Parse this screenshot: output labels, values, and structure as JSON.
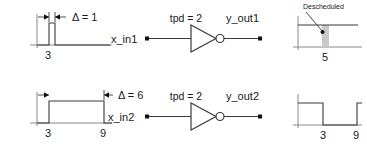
{
  "figure": {
    "rows": [
      {
        "id": "row-1",
        "input_waveform": {
          "name": "narrow-input-pulse",
          "delta_label": "Δ = 1",
          "time_labels": [
            "3"
          ],
          "edges": [
            3,
            4
          ],
          "style": "pulse-high"
        },
        "gate": {
          "name": "inverter-1",
          "tpd_label": "tpd = 2",
          "input_label": "x_in1",
          "output_label": "y_out1",
          "type": "inverter"
        },
        "output_waveform": {
          "name": "descheduled-output",
          "annotation": "Descheduled",
          "time_labels": [
            "5"
          ],
          "shaded": true,
          "style": "high-with-glitch"
        }
      },
      {
        "id": "row-2",
        "input_waveform": {
          "name": "wide-input-pulse",
          "delta_label": "Δ = 6",
          "time_labels": [
            "3",
            "9"
          ],
          "edges": [
            3,
            9
          ],
          "style": "pulse-high"
        },
        "gate": {
          "name": "inverter-2",
          "tpd_label": "tpd = 2",
          "input_label": "x_in2",
          "output_label": "y_out2",
          "type": "inverter"
        },
        "output_waveform": {
          "name": "inverted-output",
          "annotation": "",
          "time_labels": [
            "3",
            "9"
          ],
          "shaded": false,
          "style": "low-pulse"
        }
      }
    ],
    "colors": {
      "wire": "#3a3a3a",
      "axis": "#8a8a8a",
      "shade": "#c9c9c9",
      "text": "#1a1a1a"
    }
  }
}
